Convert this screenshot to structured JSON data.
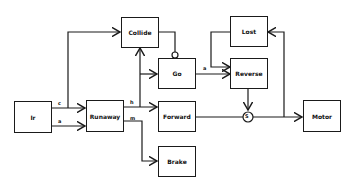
{
  "diagram": {
    "nodes": {
      "ir": "Ir",
      "runaway": "Runaway",
      "collide": "Collide",
      "go": "Go",
      "forward": "Forward",
      "brake": "Brake",
      "lost": "Lost",
      "reverse": "Reverse",
      "motor": "Motor"
    },
    "edge_labels": {
      "ir_runaway_top": "c",
      "ir_runaway_bottom": "a",
      "runaway_forward": "h",
      "runaway_brake": "m",
      "go_reverse": "a"
    },
    "suppressor_label": "S",
    "colors": {
      "line": "#1a1a1a",
      "background": "#ffffff"
    }
  }
}
